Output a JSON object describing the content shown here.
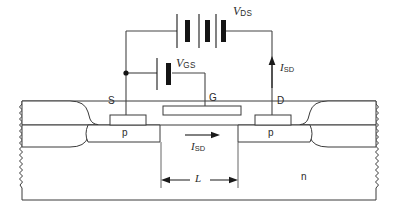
{
  "figure": {
    "type": "device-cross-section-schematic",
    "labels": {
      "vds": {
        "symbol": "V",
        "subscript": "DS",
        "text": "VDS"
      },
      "vgs": {
        "symbol": "V",
        "subscript": "GS",
        "text": "VGS"
      },
      "isd_vertical": {
        "symbol": "I",
        "subscript": "SD",
        "text": "ISD"
      },
      "isd_channel": {
        "symbol": "I",
        "subscript": "SD",
        "text": "ISD"
      },
      "source": "S",
      "gate": "G",
      "drain": "D",
      "p_left": "p",
      "p_right": "p",
      "substrate": "n",
      "length": "L"
    },
    "components": {
      "battery_vds_cells": 3,
      "battery_vgs_cells": 1,
      "junction_dots": 1
    },
    "colors": {
      "line": "#3a3a3a",
      "wire": "#444444",
      "battery": "#141414",
      "fill": "#ffffff",
      "text": "#2b2b2b",
      "background": "#ffffff"
    }
  }
}
